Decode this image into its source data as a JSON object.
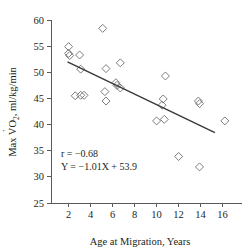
{
  "chart_data": {
    "type": "scatter",
    "title": "",
    "xlabel": "Age at Migration, Years",
    "ylabel": "Max VO2, ml/kg/min",
    "ylabel_parts": {
      "prefix": "Max V",
      "dot_over": "O",
      "subscript": "2",
      "suffix": ", ml/kg/min"
    },
    "xlim": [
      0.4,
      17.4
    ],
    "ylim": [
      25,
      60
    ],
    "xticks": [
      2,
      4,
      6,
      8,
      10,
      12,
      14,
      16
    ],
    "yticks": [
      25,
      30,
      35,
      40,
      45,
      50,
      55,
      60
    ],
    "xtick_labels": [
      "2",
      "4",
      "6",
      "8",
      "10",
      "12",
      "14",
      "16"
    ],
    "ytick_labels": [
      "25",
      "30",
      "35",
      "40",
      "45",
      "50",
      "55",
      "60"
    ],
    "grid": false,
    "legend": null,
    "marker_style": "open-diamond",
    "points": [
      {
        "x": 2.0,
        "y": 54.9
      },
      {
        "x": 2.0,
        "y": 53.6
      },
      {
        "x": 2.1,
        "y": 53.2
      },
      {
        "x": 3.0,
        "y": 53.3
      },
      {
        "x": 3.1,
        "y": 50.6
      },
      {
        "x": 2.6,
        "y": 45.5
      },
      {
        "x": 3.1,
        "y": 45.6
      },
      {
        "x": 3.4,
        "y": 45.6
      },
      {
        "x": 5.1,
        "y": 58.4
      },
      {
        "x": 5.4,
        "y": 50.7
      },
      {
        "x": 5.3,
        "y": 46.3
      },
      {
        "x": 5.4,
        "y": 44.5
      },
      {
        "x": 6.7,
        "y": 51.8
      },
      {
        "x": 6.3,
        "y": 48.0
      },
      {
        "x": 6.4,
        "y": 47.5
      },
      {
        "x": 6.7,
        "y": 47.0
      },
      {
        "x": 10.8,
        "y": 49.3
      },
      {
        "x": 10.6,
        "y": 44.9
      },
      {
        "x": 10.5,
        "y": 43.7
      },
      {
        "x": 10.0,
        "y": 40.7
      },
      {
        "x": 10.7,
        "y": 41.0
      },
      {
        "x": 12.0,
        "y": 33.9
      },
      {
        "x": 13.8,
        "y": 44.5
      },
      {
        "x": 13.9,
        "y": 44.0
      },
      {
        "x": 13.9,
        "y": 31.9
      },
      {
        "x": 16.2,
        "y": 40.7
      }
    ],
    "regression_line": {
      "slope": -1.01,
      "intercept": 53.9,
      "x_start": 1.9,
      "x_end": 15.3
    },
    "annotations": {
      "correlation": "r = −0.68",
      "equation": "Y = −1.01X + 53.9"
    }
  },
  "colors": {
    "axis": "#58595b",
    "marker": "#6d6e71",
    "line": "#3b3b3b",
    "text": "#231f20",
    "background": "#ffffff"
  }
}
